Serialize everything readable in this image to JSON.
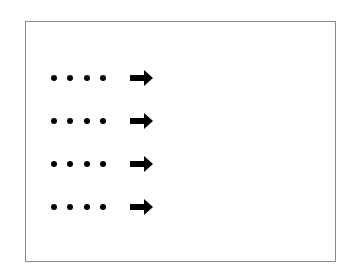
{
  "diagram": {
    "frame": {
      "border_color": "#8a8a8a",
      "background": "#ffffff"
    },
    "rows": [
      {
        "dots": 4,
        "icon": "right-arrow-icon"
      },
      {
        "dots": 4,
        "icon": "right-arrow-icon"
      },
      {
        "dots": 4,
        "icon": "right-arrow-icon"
      },
      {
        "dots": 4,
        "icon": "right-arrow-icon"
      }
    ],
    "dot_color": "#000000",
    "arrow_color": "#000000"
  }
}
